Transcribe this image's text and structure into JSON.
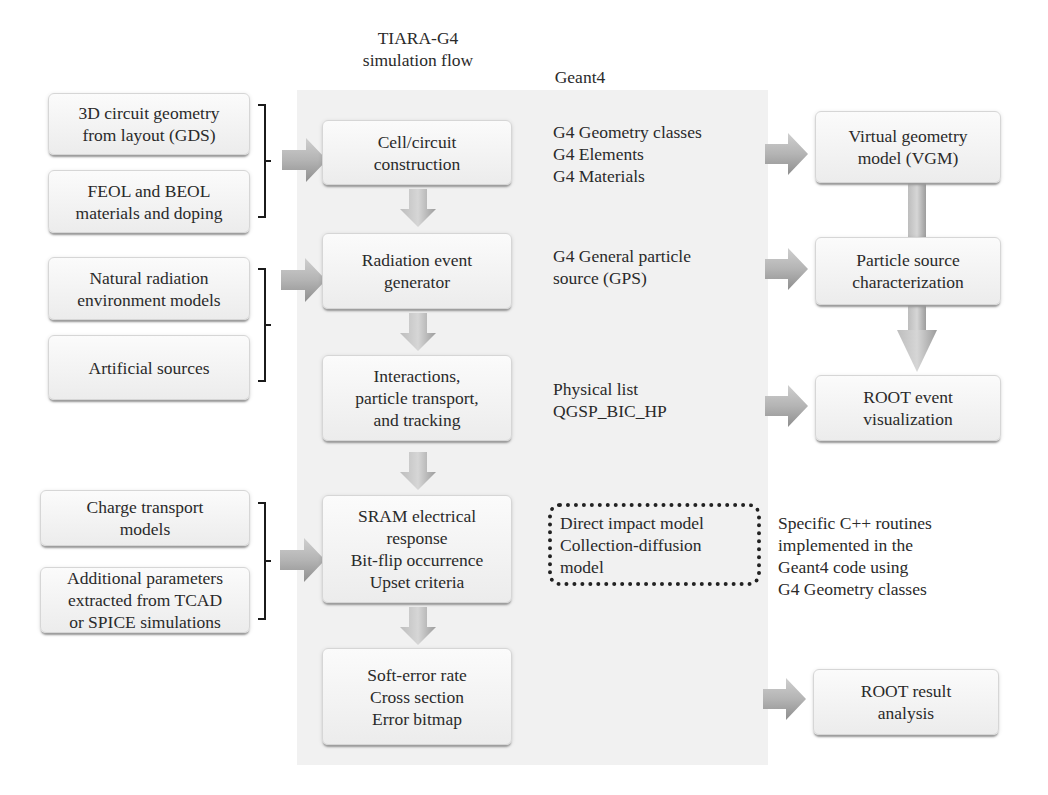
{
  "headers": {
    "flow_title": "TIARA-G4\nsimulation flow",
    "geant4_title": "Geant4"
  },
  "inputs": [
    {
      "label": "3D circuit geometry\nfrom layout (GDS)"
    },
    {
      "label": "FEOL and BEOL\nmaterials and doping"
    },
    {
      "label": "Natural radiation\nenvironment models"
    },
    {
      "label": "Artificial sources"
    },
    {
      "label": "Charge transport\nmodels"
    },
    {
      "label": "Additional parameters\nextracted from TCAD\nor SPICE simulations"
    }
  ],
  "flow_steps": [
    {
      "label": "Cell/circuit\nconstruction"
    },
    {
      "label": "Radiation event\ngenerator"
    },
    {
      "label": "Interactions,\nparticle transport,\nand tracking"
    },
    {
      "label": "SRAM electrical\nresponse\nBit-flip occurrence\nUpset criteria"
    },
    {
      "label": "Soft-error rate\nCross section\nError bitmap"
    }
  ],
  "geant4_notes": [
    {
      "label": "G4 Geometry classes\nG4 Elements\nG4 Materials"
    },
    {
      "label": "G4 General particle\nsource (GPS)"
    },
    {
      "label": "Physical list\nQGSP_BIC_HP"
    }
  ],
  "custom_models": {
    "label": "Direct impact model\nCollection-diffusion\nmodel",
    "note": "Specific C++ routines\nimplemented in the\nGeant4 code using\nG4 Geometry classes"
  },
  "outputs": [
    {
      "label": "Virtual geometry\nmodel (VGM)"
    },
    {
      "label": "Particle source\ncharacterization"
    },
    {
      "label": "ROOT event\nvisualization"
    },
    {
      "label": "ROOT result\nanalysis"
    }
  ],
  "colors": {
    "panel": "#f1f1f1",
    "box_fill": "#f6f6f6",
    "arrow": "#a8a8a8",
    "text": "#2a2a2a"
  }
}
